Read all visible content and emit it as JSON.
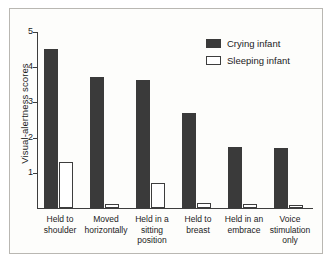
{
  "chart_data": {
    "type": "bar",
    "title": "",
    "xlabel": "",
    "ylabel": "Visual-alertness scores",
    "ylim": [
      0,
      5
    ],
    "yticks": [
      1,
      2,
      3,
      4,
      5
    ],
    "ytick_labels": [
      "1",
      "2",
      "3",
      "4",
      "5"
    ],
    "grid": false,
    "legend_position": "top-right",
    "categories": [
      "Held to shoulder",
      "Moved horizontally",
      "Held in a sitting position",
      "Held to breast",
      "Held in an embrace",
      "Voice stimulation only"
    ],
    "category_lines": [
      [
        "Held to",
        "shoulder"
      ],
      [
        "Moved",
        "horizontally"
      ],
      [
        "Held in a",
        "sitting",
        "position"
      ],
      [
        "Held to",
        "breast"
      ],
      [
        "Held in an",
        "embrace"
      ],
      [
        "Voice",
        "stimulation",
        "only"
      ]
    ],
    "series": [
      {
        "name": "Crying infant",
        "color": "#3a3a3a",
        "values": [
          4.52,
          3.72,
          3.65,
          2.7,
          1.73,
          1.7
        ]
      },
      {
        "name": "Sleeping infant",
        "color": "#ffffff",
        "values": [
          1.32,
          0.1,
          0.72,
          0.14,
          0.11,
          0.08
        ]
      }
    ]
  },
  "legend": {
    "items": [
      {
        "label": "Crying infant",
        "swatch": "filled-dark-swatch"
      },
      {
        "label": "Sleeping infant",
        "swatch": "outlined-white-swatch"
      }
    ]
  }
}
